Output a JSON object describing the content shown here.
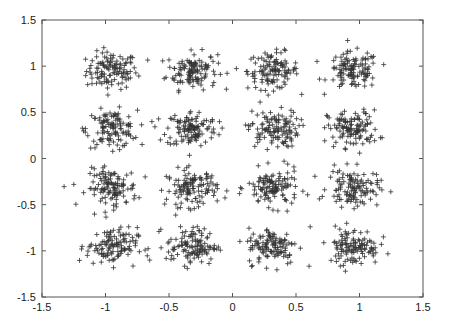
{
  "chart_data": {
    "type": "scatter",
    "title": "",
    "xlabel": "",
    "ylabel": "",
    "xlim": [
      -1.5,
      1.5
    ],
    "ylim": [
      -1.5,
      1.5
    ],
    "x_ticks": [
      "-1.5",
      "-1",
      "-0.5",
      "0",
      "0.5",
      "1",
      "1.5"
    ],
    "y_ticks": [
      "1.5",
      "1",
      "0.5",
      "0",
      "-0.5",
      "-1",
      "-1.5"
    ],
    "x_tick_values": [
      -1.5,
      -1,
      -0.5,
      0,
      0.5,
      1,
      1.5
    ],
    "y_tick_values": [
      1.5,
      1,
      0.5,
      0,
      -0.5,
      -1,
      -1.5
    ],
    "grid": false,
    "legend": null,
    "marker": "+",
    "marker_color": "#333333",
    "cluster_centers_x": [
      -0.95,
      -0.32,
      0.32,
      0.95
    ],
    "cluster_centers_y": [
      0.95,
      0.32,
      -0.32,
      -0.95
    ],
    "cluster_std": 0.1,
    "points_per_cluster": 120,
    "series": [
      {
        "name": "received symbols",
        "centers": [
          [
            -0.95,
            0.95
          ],
          [
            -0.32,
            0.95
          ],
          [
            0.32,
            0.95
          ],
          [
            0.95,
            0.95
          ],
          [
            -0.95,
            0.32
          ],
          [
            -0.32,
            0.32
          ],
          [
            0.32,
            0.32
          ],
          [
            0.95,
            0.32
          ],
          [
            -0.95,
            -0.32
          ],
          [
            -0.32,
            -0.32
          ],
          [
            0.32,
            -0.32
          ],
          [
            0.95,
            -0.32
          ],
          [
            -0.95,
            -0.95
          ],
          [
            -0.32,
            -0.95
          ],
          [
            0.32,
            -0.95
          ],
          [
            0.95,
            -0.95
          ]
        ]
      }
    ]
  },
  "colors": {
    "axis": "#555555",
    "marker": "#333333",
    "background": "#ffffff"
  }
}
